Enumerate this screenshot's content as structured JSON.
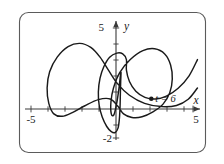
{
  "figure": {
    "title": "",
    "caption": "",
    "background_color": "#ffffff",
    "frame_color": "#5b5b5b",
    "curve_color": "#1a1a1a",
    "axis_color": "#3a3a3a"
  },
  "axes": {
    "x_label": "x",
    "y_label": "y",
    "x_min_label": "-5",
    "x_max_label": "5",
    "y_max_label": "5",
    "y_min_label": "-2"
  },
  "annotations": [
    {
      "name": "point-t6",
      "label": "t = 6",
      "x": 2.1,
      "y": 0.63
    }
  ],
  "chart_data": {
    "type": "line",
    "title": "",
    "subtitle": "",
    "xlabel": "x",
    "ylabel": "y",
    "xlim": [
      -5,
      5
    ],
    "ylim": [
      -2,
      5
    ],
    "grid": false,
    "legend": null,
    "xticks": [
      -5,
      -4,
      -3,
      -2,
      -1,
      0,
      1,
      2,
      3,
      4,
      5
    ],
    "yticks": [
      -2,
      -1,
      0,
      1,
      2,
      3,
      4,
      5
    ],
    "xtick_labels": [
      "-5",
      "",
      "",
      "",
      "",
      "",
      "",
      "",
      "",
      "",
      "5"
    ],
    "ytick_labels": [
      "-2",
      "",
      "",
      "",
      "",
      "",
      "",
      "5"
    ],
    "series": [
      {
        "name": "parametric-curve",
        "closed": false,
        "points": [
          [
            4.85,
            3.05
          ],
          [
            4.35,
            2.05
          ],
          [
            3.7,
            1.28
          ],
          [
            3.0,
            0.8
          ],
          [
            2.35,
            0.62
          ],
          [
            1.72,
            0.72
          ],
          [
            1.18,
            1.1
          ],
          [
            0.8,
            1.7
          ],
          [
            0.62,
            2.4
          ],
          [
            0.62,
            3.05
          ],
          [
            0.4,
            3.4
          ],
          [
            0.05,
            3.45
          ],
          [
            -0.38,
            3.2
          ],
          [
            -0.72,
            2.62
          ],
          [
            -0.95,
            1.9
          ],
          [
            -1.05,
            1.05
          ],
          [
            -1.0,
            0.22
          ],
          [
            -0.82,
            -0.5
          ],
          [
            -0.55,
            -1.08
          ],
          [
            -0.28,
            -1.4
          ],
          [
            -0.05,
            -1.45
          ],
          [
            0.12,
            -1.18
          ],
          [
            0.2,
            -0.62
          ],
          [
            0.24,
            0.1
          ],
          [
            0.26,
            0.95
          ],
          [
            0.28,
            1.72
          ],
          [
            0.3,
            2.25
          ],
          [
            0.26,
            2.05
          ],
          [
            0.18,
            1.3
          ],
          [
            0.05,
            0.4
          ],
          [
            -0.12,
            -0.35
          ],
          [
            -0.28,
            -0.3
          ],
          [
            -0.3,
            0.45
          ],
          [
            -0.15,
            1.3
          ],
          [
            0.22,
            2.25
          ],
          [
            0.85,
            3.05
          ],
          [
            1.6,
            3.6
          ],
          [
            2.3,
            3.72
          ],
          [
            2.9,
            3.4
          ],
          [
            3.25,
            2.72
          ],
          [
            3.35,
            1.85
          ],
          [
            3.2,
            1.0
          ],
          [
            2.8,
            0.3
          ],
          [
            2.2,
            -0.18
          ],
          [
            1.55,
            -0.48
          ],
          [
            0.95,
            -0.52
          ],
          [
            0.45,
            -0.3
          ],
          [
            0.1,
            0.18
          ],
          [
            -0.35,
            0.62
          ],
          [
            -1.05,
            0.58
          ],
          [
            -1.85,
            0.2
          ],
          [
            -2.6,
            -0.22
          ],
          [
            -3.2,
            -0.45
          ],
          [
            -3.7,
            -0.3
          ],
          [
            -4.0,
            0.35
          ],
          [
            -4.1,
            1.3
          ],
          [
            -3.95,
            2.3
          ],
          [
            -3.5,
            3.2
          ],
          [
            -2.85,
            3.85
          ],
          [
            -2.15,
            4.05
          ],
          [
            -1.5,
            3.8
          ],
          [
            -0.95,
            3.2
          ],
          [
            -0.45,
            2.4
          ],
          [
            0.1,
            1.55
          ],
          [
            0.8,
            0.85
          ],
          [
            1.7,
            0.35
          ],
          [
            2.7,
            0.15
          ],
          [
            3.6,
            0.22
          ],
          [
            4.3,
            0.6
          ],
          [
            4.85,
            1.3
          ]
        ]
      }
    ]
  }
}
